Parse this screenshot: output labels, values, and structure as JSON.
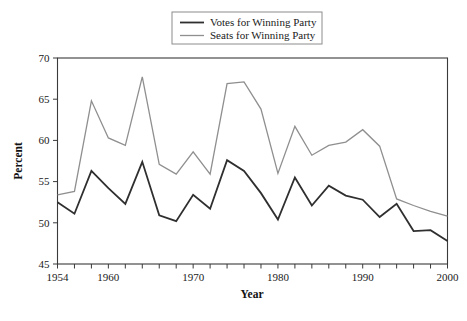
{
  "chart_data": {
    "type": "line",
    "title": "",
    "xlabel": "Year",
    "ylabel": "Percent",
    "xlim": [
      1954,
      2000
    ],
    "ylim": [
      45,
      70
    ],
    "yticks": [
      45,
      50,
      55,
      60,
      65,
      70
    ],
    "ytick_labels": [
      "45",
      "50",
      "55",
      "60",
      "65",
      "70"
    ],
    "xticks": [
      1954,
      1956,
      1958,
      1960,
      1962,
      1964,
      1966,
      1968,
      1970,
      1972,
      1974,
      1976,
      1978,
      1980,
      1982,
      1984,
      1986,
      1988,
      1990,
      1992,
      1994,
      1996,
      1998,
      2000
    ],
    "xtick_labels": [
      "1954",
      "1960",
      "1970",
      "1980",
      "1990",
      "2000"
    ],
    "xtick_labeled_values": [
      1954,
      1960,
      1970,
      1980,
      1990,
      2000
    ],
    "grid": false,
    "legend_position": "top-center",
    "x": [
      1954,
      1956,
      1958,
      1960,
      1962,
      1964,
      1966,
      1968,
      1970,
      1972,
      1974,
      1976,
      1978,
      1980,
      1982,
      1984,
      1986,
      1988,
      1990,
      1992,
      1994,
      1996,
      1998,
      2000
    ],
    "series": [
      {
        "name": "Votes for Winning Party",
        "color": "#2f2f2f",
        "width": 1.8,
        "values": [
          52.5,
          51.1,
          56.3,
          54.2,
          52.3,
          57.4,
          50.9,
          50.2,
          53.4,
          51.7,
          57.6,
          56.3,
          53.6,
          50.4,
          55.5,
          52.1,
          54.5,
          53.3,
          52.8,
          50.7,
          52.3,
          49.0,
          49.1,
          47.8
        ]
      },
      {
        "name": "Seats for Winning Party",
        "color": "#8f8f8f",
        "width": 1.3,
        "values": [
          53.4,
          53.8,
          64.8,
          60.3,
          59.4,
          67.7,
          57.1,
          55.9,
          58.6,
          55.9,
          66.9,
          67.1,
          63.8,
          56.0,
          61.7,
          58.2,
          59.4,
          59.8,
          61.3,
          59.3,
          52.9,
          52.1,
          51.4,
          50.8
        ]
      }
    ]
  },
  "legend": {
    "items": [
      {
        "label": "Votes for Winning Party"
      },
      {
        "label": "Seats for Winning Party"
      }
    ]
  },
  "axes": {
    "y_title": "Percent",
    "x_title": "Year"
  }
}
